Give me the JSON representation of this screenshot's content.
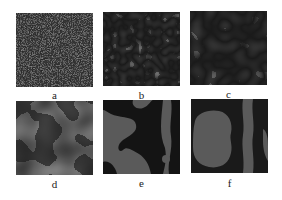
{
  "figure": {
    "panels": [
      {
        "id": "a",
        "label": "a",
        "stage": "fine noise"
      },
      {
        "id": "b",
        "label": "b",
        "stage": "fine labyrinth"
      },
      {
        "id": "c",
        "label": "c",
        "stage": "medium labyrinth"
      },
      {
        "id": "d",
        "label": "d",
        "stage": "coarse domains"
      },
      {
        "id": "e",
        "label": "e",
        "stage": "large domains"
      },
      {
        "id": "f",
        "label": "f",
        "stage": "very large domains"
      }
    ],
    "colors": {
      "dark": "#141414",
      "light": "#5a5a5a",
      "background": "#ffffff"
    }
  }
}
